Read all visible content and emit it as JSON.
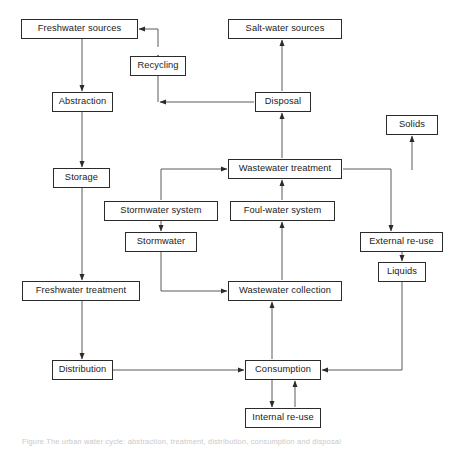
{
  "diagram": {
    "caption": "Figure  The urban water cycle: abstraction, treatment, distribution, consumption and disposal",
    "stroke_color": "#2b2b2b",
    "background_color": "#ffffff",
    "nodes": [
      {
        "id": "freshwater-sources",
        "label": "Freshwater sources",
        "x": 21,
        "y": 19,
        "w": 117,
        "h": 20
      },
      {
        "id": "salt-water-sources",
        "label": "Salt-water sources",
        "x": 228,
        "y": 19,
        "w": 114,
        "h": 20
      },
      {
        "id": "recycling",
        "label": "Recycling",
        "x": 130,
        "y": 56,
        "w": 56,
        "h": 20
      },
      {
        "id": "abstraction",
        "label": "Abstraction",
        "x": 52,
        "y": 92,
        "w": 61,
        "h": 20
      },
      {
        "id": "disposal",
        "label": "Disposal",
        "x": 255,
        "y": 92,
        "w": 56,
        "h": 20
      },
      {
        "id": "solids",
        "label": "Solids",
        "x": 386,
        "y": 115,
        "w": 52,
        "h": 20
      },
      {
        "id": "wastewater-treatment",
        "label": "Wastewater treatment",
        "x": 228,
        "y": 159,
        "w": 114,
        "h": 20
      },
      {
        "id": "storage",
        "label": "Storage",
        "x": 53,
        "y": 168,
        "w": 57,
        "h": 20
      },
      {
        "id": "stormwater-system",
        "label": "Stormwater system",
        "x": 104,
        "y": 201,
        "w": 114,
        "h": 20
      },
      {
        "id": "foul-water-system",
        "label": "Foul-water system",
        "x": 230,
        "y": 201,
        "w": 105,
        "h": 20
      },
      {
        "id": "stormwater",
        "label": "Stormwater",
        "x": 125,
        "y": 232,
        "w": 72,
        "h": 20
      },
      {
        "id": "external-re-use",
        "label": "External re-use",
        "x": 360,
        "y": 232,
        "w": 83,
        "h": 20
      },
      {
        "id": "liquids",
        "label": "Liquids",
        "x": 378,
        "y": 262,
        "w": 48,
        "h": 20
      },
      {
        "id": "freshwater-treatment",
        "label": "Freshwater treatment",
        "x": 22,
        "y": 281,
        "w": 118,
        "h": 20
      },
      {
        "id": "wastewater-collection",
        "label": "Wastewater collection",
        "x": 228,
        "y": 281,
        "w": 114,
        "h": 20
      },
      {
        "id": "distribution",
        "label": "Distribution",
        "x": 52,
        "y": 360,
        "w": 61,
        "h": 20
      },
      {
        "id": "consumption",
        "label": "Consumption",
        "x": 245,
        "y": 360,
        "w": 76,
        "h": 20
      },
      {
        "id": "internal-re-use",
        "label": "Internal re-use",
        "x": 245,
        "y": 408,
        "w": 76,
        "h": 20
      }
    ],
    "edges": [
      {
        "id": "freshwater-sources-to-abstraction",
        "from": "freshwater-sources",
        "to": "abstraction",
        "points": "82,39 82,91"
      },
      {
        "id": "abstraction-to-storage",
        "from": "abstraction",
        "to": "storage",
        "points": "82,112 82,167"
      },
      {
        "id": "storage-to-freshwater-treatment",
        "from": "storage",
        "to": "freshwater-treatment",
        "points": "82,188 82,280"
      },
      {
        "id": "freshwater-treatment-to-distribution",
        "from": "freshwater-treatment",
        "to": "distribution",
        "points": "82,301 82,359"
      },
      {
        "id": "distribution-to-consumption",
        "from": "distribution",
        "to": "consumption",
        "points": "113,370 244,370"
      },
      {
        "id": "consumption-to-internal-re-use",
        "from": "consumption",
        "to": "internal-re-use",
        "points": "272,380 272,407"
      },
      {
        "id": "internal-re-use-to-consumption",
        "from": "internal-re-use",
        "to": "consumption",
        "points": "295,407 295,381"
      },
      {
        "id": "consumption-to-wastewater-collection",
        "from": "consumption",
        "to": "wastewater-collection",
        "points": "272,359 272,302"
      },
      {
        "id": "wastewater-collection-to-foul-water",
        "from": "wastewater-collection",
        "to": "foul-water-system",
        "points": "282,280 282,222"
      },
      {
        "id": "foul-water-to-wastewater-treatment",
        "from": "foul-water-system",
        "to": "wastewater-treatment",
        "points": "282,200 282,180"
      },
      {
        "id": "stormwater-system-to-stormwater",
        "from": "stormwater-system",
        "to": "stormwater",
        "points": "161,221 161,231"
      },
      {
        "id": "stormwater-to-wastewater-collection",
        "from": "stormwater",
        "to": "wastewater-collection",
        "points": "161,252 161,291 227,291"
      },
      {
        "id": "stormwater-system-to-wastewater-treatment",
        "from": "stormwater-system",
        "to": "wastewater-treatment",
        "points": "161,200 161,169 227,169"
      },
      {
        "id": "wastewater-treatment-to-disposal",
        "from": "wastewater-treatment",
        "to": "disposal",
        "points": "282,158 282,113"
      },
      {
        "id": "disposal-to-salt-water-sources",
        "from": "disposal",
        "to": "salt-water-sources",
        "points": "282,91 282,40"
      },
      {
        "id": "disposal-to-recycling-elbow",
        "from": "disposal",
        "to": "recycling",
        "points": "254,102 160,102"
      },
      {
        "id": "recycling-to-freshwater-sources",
        "from": "recycling",
        "to": "freshwater-sources",
        "points": "158,102 158,86 158,55"
      },
      {
        "id": "recycling-elbow-to-freshwater-sources",
        "from": "recycling",
        "to": "freshwater-sources",
        "points": "158,47 158,29 139,29"
      },
      {
        "id": "wastewater-treatment-to-external-re-use",
        "from": "wastewater-treatment",
        "to": "external-re-use",
        "points": "343,169 391,169 391,231"
      },
      {
        "id": "wastewater-treatment-to-solids",
        "from": "wastewater-treatment",
        "to": "solids",
        "points": "412,170 412,136"
      },
      {
        "id": "external-re-use-to-liquids",
        "from": "external-re-use",
        "to": "liquids",
        "points": "402,252 402,261"
      },
      {
        "id": "liquids-to-consumption",
        "from": "liquids",
        "to": "consumption",
        "points": "402,282 402,370 322,370"
      }
    ]
  }
}
